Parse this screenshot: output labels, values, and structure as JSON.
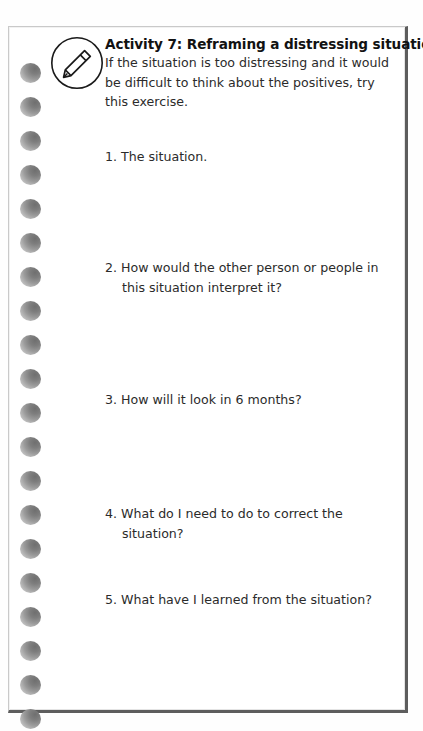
{
  "document": {
    "type": "worksheet-page",
    "title": "Activity 7: Reframing a distressing situation",
    "icon": "pencil-icon",
    "intro": "If the situation is too distressing and it would be difficult to think about the positives, try this exercise.",
    "questions": [
      {
        "number": "1.",
        "text": "The situation.",
        "top": 120
      },
      {
        "number": "2.",
        "text": "How would the other person or people in this situation interpret it?",
        "top": 231
      },
      {
        "number": "3.",
        "text": "How will it look in 6 months?",
        "top": 363
      },
      {
        "number": "4.",
        "text": "What do I need to do to correct the situation?",
        "top": 477
      },
      {
        "number": "5.",
        "text": "What have I learned from the situation?",
        "top": 563
      }
    ],
    "binding": {
      "hole_count": 20,
      "first_hole_top": 36,
      "hole_spacing": 34
    },
    "colors": {
      "page_background": "#ffffff",
      "card_border_light": "#c9c9c9",
      "card_border_dark": "#5d5d5d",
      "text": "#2b2b2b",
      "title_text": "#121212",
      "hole_fill": "#8a8a8a"
    }
  }
}
